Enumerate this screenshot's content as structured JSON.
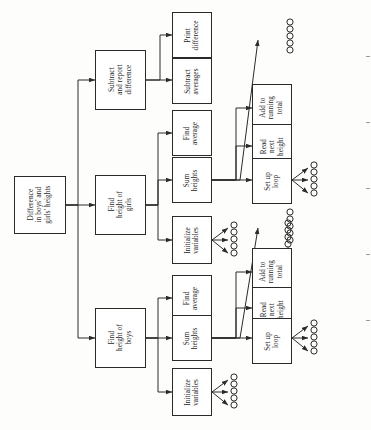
{
  "diagram": {
    "type": "structure-chart",
    "orientation": "rotated-90-ccw",
    "colors": {
      "box_border": "#2a2a2a",
      "box_fill": "#ffffff",
      "line": "#2b2b2b",
      "page": "#fdfdfb"
    },
    "levels": [
      {
        "index": 0,
        "name": "root"
      },
      {
        "index": 1,
        "name": "major-tasks"
      },
      {
        "index": 2,
        "name": "sub-tasks"
      },
      {
        "index": 3,
        "name": "detail-steps"
      }
    ],
    "nodes": [
      {
        "id": "root",
        "level": 0,
        "label": "Difference in boys' and girls' heights",
        "lines": [
          "Difference",
          "in boys' and",
          "girls' heights"
        ]
      },
      {
        "id": "subtract-report",
        "level": 1,
        "label": "Subtract and report difference",
        "lines": [
          "Subtract",
          "and report",
          "difference"
        ]
      },
      {
        "id": "height-girls",
        "level": 1,
        "label": "Find height of girls",
        "lines": [
          "Find",
          "height of",
          "girls"
        ]
      },
      {
        "id": "height-boys",
        "level": 1,
        "label": "Find height of boys",
        "lines": [
          "Find",
          "height of",
          "boys"
        ]
      },
      {
        "id": "print-difference",
        "level": 2,
        "label": "Print difference",
        "lines": [
          "Print",
          "difference"
        ]
      },
      {
        "id": "subtract-avgs",
        "level": 2,
        "label": "Subtract averages",
        "lines": [
          "Subtract",
          "averages"
        ]
      },
      {
        "id": "find-avg-girls",
        "level": 2,
        "label": "Find average",
        "lines": [
          "Find",
          "average"
        ]
      },
      {
        "id": "sum-heights-girls",
        "level": 2,
        "label": "Sum heights",
        "lines": [
          "Sum",
          "heights"
        ]
      },
      {
        "id": "init-vars-girls",
        "level": 2,
        "label": "Initialize variables",
        "lines": [
          "Initialize",
          "variables"
        ]
      },
      {
        "id": "find-avg-boys",
        "level": 2,
        "label": "Find average",
        "lines": [
          "Find",
          "average"
        ]
      },
      {
        "id": "sum-heights-boys",
        "level": 2,
        "label": "Sum heights",
        "lines": [
          "Sum",
          "heights"
        ]
      },
      {
        "id": "init-vars-boys",
        "level": 2,
        "label": "Initialize variables",
        "lines": [
          "Initialize",
          "variables"
        ]
      },
      {
        "id": "add-total-girls",
        "level": 3,
        "label": "Add to running total",
        "lines": [
          "Add to",
          "running",
          "total"
        ]
      },
      {
        "id": "read-next-girls",
        "level": 3,
        "label": "Read next height",
        "lines": [
          "Read",
          "next",
          "height"
        ]
      },
      {
        "id": "setup-loop-girls",
        "level": 3,
        "label": "Set up loop",
        "lines": [
          "Set up",
          "loop"
        ]
      },
      {
        "id": "add-total-boys",
        "level": 3,
        "label": "Add to running total",
        "lines": [
          "Add to",
          "running",
          "total"
        ]
      },
      {
        "id": "read-next-boys",
        "level": 3,
        "label": "Read next height",
        "lines": [
          "Read",
          "next",
          "height"
        ]
      },
      {
        "id": "setup-loop-boys",
        "level": 3,
        "label": "Set up loop",
        "lines": [
          "Set up",
          "loop"
        ]
      }
    ],
    "edges": [
      {
        "from": "root",
        "to": "subtract-report"
      },
      {
        "from": "root",
        "to": "height-girls"
      },
      {
        "from": "root",
        "to": "height-boys"
      },
      {
        "from": "subtract-report",
        "to": "print-difference"
      },
      {
        "from": "subtract-report",
        "to": "subtract-avgs"
      },
      {
        "from": "height-girls",
        "to": "find-avg-girls"
      },
      {
        "from": "height-girls",
        "to": "sum-heights-girls"
      },
      {
        "from": "height-girls",
        "to": "init-vars-girls"
      },
      {
        "from": "height-boys",
        "to": "find-avg-boys"
      },
      {
        "from": "height-boys",
        "to": "sum-heights-boys"
      },
      {
        "from": "height-boys",
        "to": "init-vars-boys"
      },
      {
        "from": "sum-heights-girls",
        "to": "add-total-girls"
      },
      {
        "from": "sum-heights-girls",
        "to": "read-next-girls"
      },
      {
        "from": "sum-heights-girls",
        "to": "setup-loop-girls"
      },
      {
        "from": "sum-heights-boys",
        "to": "add-total-boys"
      },
      {
        "from": "sum-heights-boys",
        "to": "read-next-boys"
      },
      {
        "from": "sum-heights-boys",
        "to": "setup-loop-boys"
      }
    ],
    "circle_groups": [
      {
        "id": "ellipsis-girls-init",
        "count": 5,
        "attached_to": "init-vars-girls",
        "connected": true
      },
      {
        "id": "ellipsis-girls-loop",
        "count": 5,
        "attached_to": "setup-loop-girls",
        "connected": true
      },
      {
        "id": "ellipsis-girls-sum",
        "count": 5,
        "attached_to": null,
        "connected": false
      },
      {
        "id": "ellipsis-girls-extra",
        "count": 5,
        "attached_to": null,
        "connected": false
      },
      {
        "id": "ellipsis-boys-init",
        "count": 5,
        "attached_to": "init-vars-boys",
        "connected": true
      },
      {
        "id": "ellipsis-boys-loop",
        "count": 5,
        "attached_to": "setup-loop-boys",
        "connected": true
      },
      {
        "id": "ellipsis-boys-sum",
        "count": 5,
        "attached_to": null,
        "connected": false
      }
    ]
  }
}
